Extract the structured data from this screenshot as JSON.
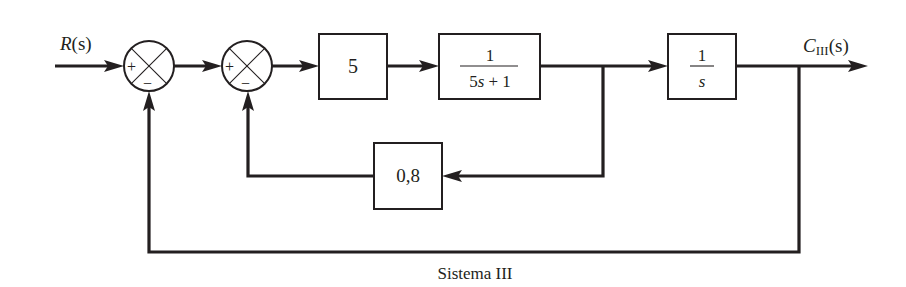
{
  "diagram": {
    "caption": "Sistema III",
    "input_label": {
      "main": "R",
      "arg": "(s)"
    },
    "output_label": {
      "main": "C",
      "sub": "III",
      "arg": "(s)"
    },
    "summing_junctions": [
      {
        "id": "sum1",
        "plus_sign": "+",
        "minus_sign": "−"
      },
      {
        "id": "sum2",
        "plus_sign": "+",
        "minus_sign": "−"
      }
    ],
    "blocks": [
      {
        "id": "gain-5",
        "label": "5"
      },
      {
        "id": "first-order",
        "numerator": "1",
        "denominator_coef": "5",
        "denominator_var": "s",
        "denominator_rest": " + 1"
      },
      {
        "id": "integrator",
        "numerator": "1",
        "denominator_var": "s"
      },
      {
        "id": "feedback-gain",
        "label": "0,8"
      }
    ],
    "connections": [
      "R(s) -> sum1(+)",
      "sum1 -> sum2(+)",
      "sum2 -> 5",
      "5 -> 1/(5s+1)",
      "1/(5s+1) -> 1/s",
      "1/(5s+1) -> 0,8 -> sum2(-)",
      "1/s -> C_III(s)",
      "C_III(s) -> sum1(-)"
    ]
  }
}
